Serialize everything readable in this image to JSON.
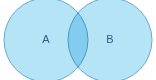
{
  "figure": {
    "type": "venn-diagram",
    "title": "",
    "background_color": "#ffffff",
    "width": 156,
    "height": 80
  },
  "style": {
    "circle_fill": "#b6e4f7",
    "circle_stroke": "#69a9cc",
    "circle_stroke_width": 1,
    "label_color": "#2b5d8c",
    "overlap_fill": "#b6e4f7"
  },
  "sets": [
    {
      "id": "set-a",
      "label": "A",
      "cx": 46,
      "cy": 40,
      "r": 42,
      "label_x": 46,
      "label_y": 40,
      "fill": "#b6e4f7",
      "stroke": "#69a9cc"
    },
    {
      "id": "set-b",
      "label": "B",
      "cx": 110,
      "cy": 40,
      "r": 42,
      "label_x": 110,
      "label_y": 40,
      "fill": "#b6e4f7",
      "stroke": "#69a9cc"
    }
  ],
  "intersection": {
    "label": "",
    "left_edge_x": 68,
    "right_edge_x": 88,
    "top_crossing_y": 12,
    "bottom_crossing_y": 68
  }
}
